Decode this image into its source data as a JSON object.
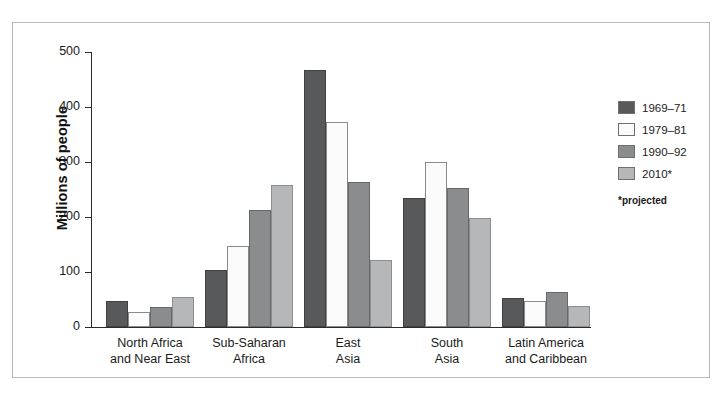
{
  "chart_data": {
    "type": "bar",
    "title": "",
    "xlabel": "",
    "ylabel": "Millions of people",
    "ylim": [
      0,
      500
    ],
    "yticks": [
      0,
      100,
      200,
      300,
      400,
      500
    ],
    "ytick_labels": [
      "0",
      "100",
      "200",
      "300",
      "400",
      "500"
    ],
    "grid": false,
    "legend_position": "right",
    "categories": [
      "North Africa\nand Near East",
      "Sub-Saharan\nAfrica",
      "East\nAsia",
      "South\nAsia",
      "Latin America\nand Caribbean"
    ],
    "category_lines": [
      [
        "North Africa",
        "and Near East"
      ],
      [
        "Sub-Saharan",
        "Africa"
      ],
      [
        "East",
        "Asia"
      ],
      [
        "South",
        "Asia"
      ],
      [
        "Latin America",
        "and Caribbean"
      ]
    ],
    "series": [
      {
        "name": "1969–71",
        "color": "#58595b",
        "values": [
          48,
          103,
          468,
          235,
          53
        ]
      },
      {
        "name": "1979–81",
        "color": "#fbfbfb",
        "values": [
          27,
          148,
          372,
          300,
          48
        ]
      },
      {
        "name": "1990–92",
        "color": "#8b8c8e",
        "values": [
          37,
          213,
          264,
          252,
          64
        ]
      },
      {
        "name": "2010*",
        "color": "#b6b7b9",
        "values": [
          54,
          259,
          122,
          199,
          39
        ]
      }
    ],
    "annotations": [
      "*projected"
    ]
  },
  "legend": {
    "items": [
      {
        "label": "1969–71"
      },
      {
        "label": "1979–81"
      },
      {
        "label": "1990–92"
      },
      {
        "label": "2010*"
      }
    ],
    "note": "*projected"
  },
  "axis": {
    "y_title": "Millions of people",
    "y_ticks": [
      "500",
      "400",
      "300",
      "200",
      "100",
      "0"
    ]
  }
}
